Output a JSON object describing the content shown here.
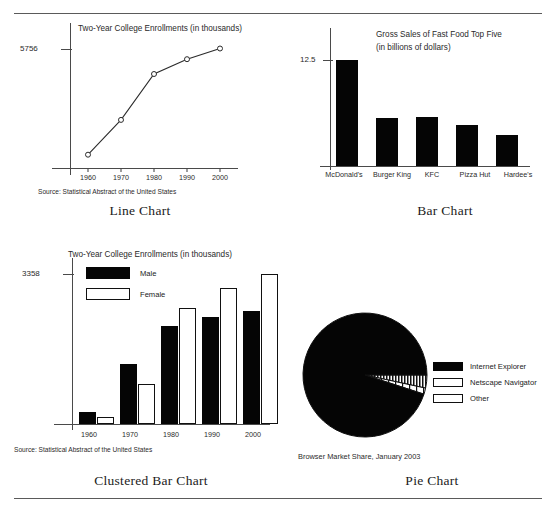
{
  "figure": {
    "caption_line": "Line Chart",
    "caption_bar": "Bar Chart",
    "caption_clustered": "Clustered Bar Chart",
    "caption_pie": "Pie Chart"
  },
  "source_note": "Source: Statistical Abstract of the United States",
  "colors": {
    "ink": "#050505",
    "axis": "#4a4a4a",
    "rule": "#5a5a5a",
    "paper": "#ffffff"
  },
  "chart_data": [
    {
      "type": "line",
      "title": "Two-Year College Enrollments (in thousands)",
      "xlabel": "",
      "ylabel": "",
      "categories": [
        "1960",
        "1970",
        "1980",
        "1990",
        "2000"
      ],
      "x": [
        1960,
        1970,
        1980,
        1990,
        2000
      ],
      "values": [
        640,
        2319,
        4526,
        5240,
        5756
      ],
      "ylim": [
        0,
        5756
      ],
      "ytick_labels": [
        "5756"
      ],
      "yticks": [
        5756
      ],
      "grid": false,
      "legend": "none",
      "marker": "open-circle",
      "annotation": "Source: Statistical Abstract of the United States"
    },
    {
      "type": "bar",
      "title": "Gross Sales of Fast Food Top Five",
      "subtitle": "(in billions of dollars)",
      "xlabel": "",
      "ylabel": "",
      "categories": [
        "McDonald's",
        "Burger King",
        "KFC",
        "Pizza Hut",
        "Hardee's"
      ],
      "values": [
        12.5,
        5.6,
        5.7,
        4.8,
        3.6
      ],
      "ylim": [
        0,
        13.7
      ],
      "ytick_labels": [
        "12.5"
      ],
      "yticks": [
        12.5
      ],
      "grid": false,
      "legend": "none"
    },
    {
      "type": "bar",
      "title": "Two-Year College Enrollments (in thousands)",
      "xlabel": "",
      "ylabel": "",
      "categories": [
        "1960",
        "1970",
        "1980",
        "1990",
        "2000"
      ],
      "series": [
        {
          "name": "Male",
          "values": [
            280,
            1350,
            2190,
            2390,
            2530
          ],
          "fill": "solid-black"
        },
        {
          "name": "Female",
          "values": [
            160,
            900,
            2600,
            3030,
            3358
          ],
          "fill": "white-outline"
        }
      ],
      "ylim": [
        0,
        3358
      ],
      "ytick_labels": [
        "3358"
      ],
      "yticks": [
        3358
      ],
      "grid": false,
      "legend": "inside-top-left",
      "annotation": "Source: Statistical Abstract of the United States"
    },
    {
      "type": "pie",
      "title": "Browser Market Share, January 2003",
      "labels": [
        "Internet Explorer",
        "Netscape Navigator",
        "Other"
      ],
      "values": [
        95.0,
        3.4,
        1.6
      ],
      "fills": [
        "solid-black",
        "dense-vertical-stripes",
        "wide-vertical-stripes"
      ],
      "legend": "right",
      "start_angle": 0
    }
  ]
}
